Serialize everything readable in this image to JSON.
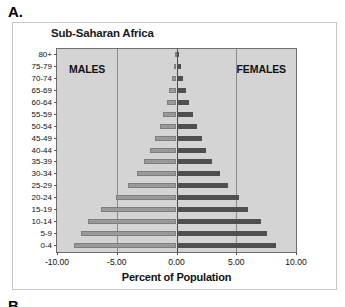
{
  "panel": {
    "letter_a": "A.",
    "letter_b": "B."
  },
  "chart_title": "Sub-Saharan Africa",
  "labels": {
    "males": "MALES",
    "females": "FEMALES"
  },
  "chart_data": {
    "type": "bar",
    "orientation": "horizontal",
    "subtype": "population-pyramid",
    "title": "Sub-Saharan Africa",
    "xlabel": "Percent of Population",
    "ylabel": "",
    "xlim": [
      -10,
      10
    ],
    "xticks": [
      -10,
      -5,
      0,
      5,
      10
    ],
    "xtick_labels": [
      "-10.00",
      "-5.00",
      "0.00",
      "5.00",
      "10.00"
    ],
    "grid": true,
    "legend": [
      "MALES",
      "FEMALES"
    ],
    "legend_position": "in-plot-top-corners",
    "categories": [
      "80+",
      "75-79",
      "70-74",
      "65-69",
      "60-64",
      "55-59",
      "50-54",
      "45-49",
      "40-44",
      "35-39",
      "30-34",
      "25-29",
      "20-24",
      "15-19",
      "10-14",
      "5-9",
      "0-4"
    ],
    "series": [
      {
        "name": "MALES",
        "color": "#9a9a9a",
        "side": "left",
        "values": [
          -0.15,
          -0.25,
          -0.4,
          -0.6,
          -0.8,
          -1.1,
          -1.4,
          -1.8,
          -2.2,
          -2.7,
          -3.3,
          -4.1,
          -5.1,
          -6.3,
          -7.4,
          -8.0,
          -8.6
        ]
      },
      {
        "name": "FEMALES",
        "color": "#4f4f4f",
        "side": "right",
        "values": [
          0.2,
          0.35,
          0.55,
          0.8,
          1.05,
          1.35,
          1.7,
          2.1,
          2.5,
          3.0,
          3.6,
          4.3,
          5.2,
          6.0,
          7.1,
          7.6,
          8.3
        ]
      }
    ]
  }
}
